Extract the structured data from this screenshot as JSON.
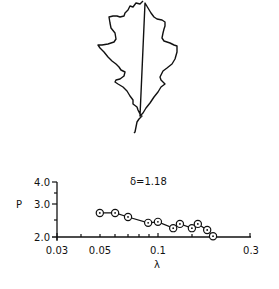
{
  "figure": {
    "leaf_description": "Outline of a lobed oak leaf with stem"
  },
  "chart_data": {
    "type": "scatter",
    "title": "",
    "annotation": "δ=1.18",
    "xlabel": "λ",
    "ylabel": "P",
    "xscale": "log",
    "yscale": "log",
    "xlim": [
      0.03,
      0.3
    ],
    "ylim": [
      2.0,
      4.0
    ],
    "xticks": [
      "0.03",
      "0.05",
      "0.1",
      "0.3"
    ],
    "yticks": [
      "2.0",
      "3.0",
      "4.0"
    ],
    "grid": false,
    "legend": null,
    "series": [
      {
        "name": "leaf perimeter",
        "marker": "circle-dot",
        "connected": true,
        "x": [
          0.05,
          0.06,
          0.07,
          0.089,
          0.1,
          0.12,
          0.13,
          0.15,
          0.161,
          0.18,
          0.193
        ],
        "y": [
          2.69,
          2.69,
          2.56,
          2.38,
          2.41,
          2.23,
          2.35,
          2.23,
          2.35,
          2.18,
          2.02
        ]
      }
    ]
  }
}
